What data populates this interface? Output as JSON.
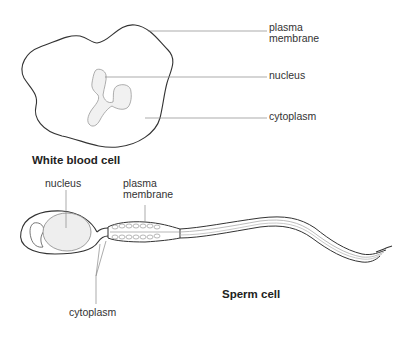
{
  "white_blood_cell": {
    "title": "White blood cell",
    "labels": {
      "plasma_membrane_line1": "plasma",
      "plasma_membrane_line2": "membrane",
      "nucleus": "nucleus",
      "cytoplasm": "cytoplasm"
    }
  },
  "sperm_cell": {
    "title": "Sperm cell",
    "labels": {
      "nucleus": "nucleus",
      "plasma_membrane_line1": "plasma",
      "plasma_membrane_line2": "membrane",
      "cytoplasm": "cytoplasm"
    }
  },
  "colors": {
    "outline": "#333333",
    "leader_line": "#888888",
    "nucleus_fill": "#ececec",
    "text": "#333333"
  }
}
